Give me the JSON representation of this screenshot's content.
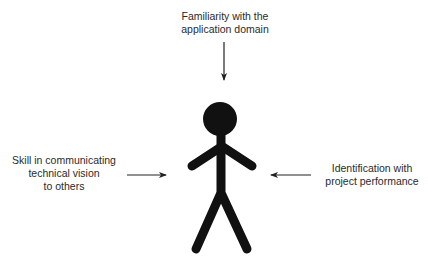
{
  "diagram": {
    "title": "",
    "center": {
      "icon": "stick-figure-person",
      "color": "#111111"
    },
    "influences": [
      {
        "position": "top",
        "lines": [
          "Familiarity with the",
          "application domain"
        ],
        "arrow": "down"
      },
      {
        "position": "left",
        "lines": [
          "Skill in communicating",
          "technical vision",
          "to others"
        ],
        "arrow": "right"
      },
      {
        "position": "right",
        "lines": [
          "Identification with",
          "project performance"
        ],
        "arrow": "left"
      }
    ],
    "colors": {
      "text": "#2a2a2a",
      "arrow": "#222222",
      "figure": "#111111",
      "background": "#ffffff"
    }
  }
}
